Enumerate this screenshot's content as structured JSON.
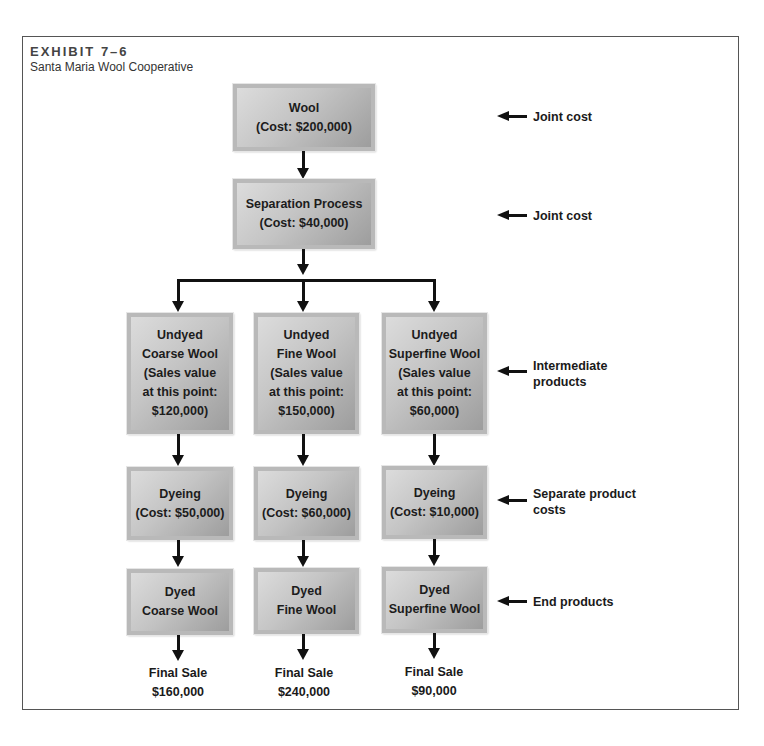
{
  "exhibit": {
    "number": "EXHIBIT 7–6",
    "title": "Santa Maria Wool Cooperative"
  },
  "nodes": {
    "wool": "Wool\n(Cost: $200,000)",
    "separation": "Separation Process\n(Cost: $40,000)",
    "undyed": [
      "Undyed\nCoarse Wool\n(Sales value\nat this point:\n$120,000)",
      "Undyed\nFine Wool\n(Sales value\nat this point:\n$150,000)",
      "Undyed\nSuperfine Wool\n(Sales value\nat this point:\n$60,000)"
    ],
    "dyeing": [
      "Dyeing\n(Cost: $50,000)",
      "Dyeing\n(Cost: $60,000)",
      "Dyeing\n(Cost: $10,000)"
    ],
    "dyed": [
      "Dyed\nCoarse Wool",
      "Dyed\nFine Wool",
      "Dyed\nSuperfine Wool"
    ],
    "final_sale": [
      {
        "label": "Final Sale",
        "value": "$160,000"
      },
      {
        "label": "Final Sale",
        "value": "$240,000"
      },
      {
        "label": "Final Sale",
        "value": "$90,000"
      }
    ]
  },
  "side_labels": [
    "Joint cost",
    "Joint cost",
    "Intermediate\nproducts",
    "Separate product\ncosts",
    "End products"
  ],
  "colors": {
    "box_light": "#dcdcdc",
    "box_dark": "#9d9d9d",
    "box_border": "#b9b9b9",
    "line": "#111111",
    "frame": "#555555"
  }
}
